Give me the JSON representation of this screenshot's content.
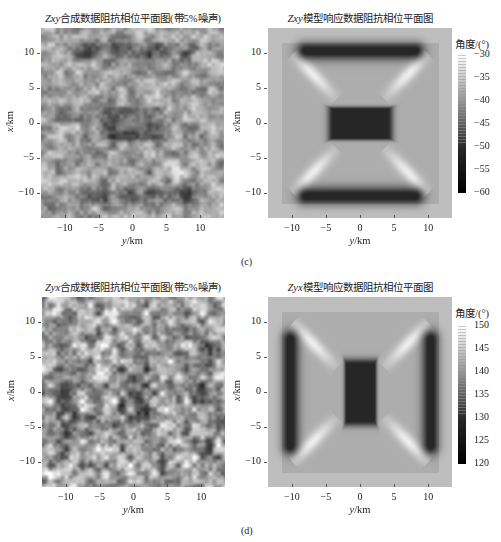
{
  "chart_data": [
    {
      "type": "heatmap",
      "id": "c-left",
      "title_italic": "Zxy",
      "title_rest": "合成数据阻抗相位平面图(带5%噪声)",
      "xlabel_italic": "y",
      "xlabel_rest": "/km",
      "ylabel_italic": "x",
      "ylabel_rest": "/km",
      "xticks": [
        -10,
        -5,
        0,
        5,
        10
      ],
      "yticks": [
        10,
        5,
        0,
        -5,
        -10
      ],
      "xlim": [
        -13.5,
        13.5
      ],
      "ylim": [
        -13.5,
        13.5
      ],
      "colorbar": null,
      "description": "Noisy synthetic Zxy phase map; dark horizontal bands near x=10 and x=-10, dark cluster near center"
    },
    {
      "type": "heatmap",
      "id": "c-right",
      "title_italic": "Zxy",
      "title_rest": "模型响应数据阻抗相位平面图",
      "xlabel_italic": "y",
      "xlabel_rest": "/km",
      "ylabel_italic": "x",
      "ylabel_rest": "/km",
      "xticks": [
        -10,
        -5,
        0,
        5,
        10
      ],
      "yticks": [
        10,
        5,
        0,
        -5,
        -10
      ],
      "xlim": [
        -13.5,
        13.5
      ],
      "ylim": [
        -13.5,
        13.5
      ],
      "colorbar": {
        "title": "角度/(°)",
        "ticks": [
          -30,
          -35,
          -40,
          -45,
          -50,
          -55,
          -60
        ],
        "range": [
          -60,
          -30
        ]
      },
      "description": "Model response Zxy phase; dark horizontal bars at x≈±10, dark rectangle at center, bright diagonal streaks"
    },
    {
      "type": "heatmap",
      "id": "d-left",
      "title_italic": "Zyx",
      "title_rest": "合成数据阻抗相位平面图(带5%噪声)",
      "xlabel_italic": "y",
      "xlabel_rest": "/km",
      "ylabel_italic": "x",
      "ylabel_rest": "/km",
      "xticks": [
        -10,
        -5,
        0,
        5,
        10
      ],
      "yticks": [
        10,
        5,
        0,
        -5,
        -10
      ],
      "xlim": [
        -13.5,
        13.5
      ],
      "ylim": [
        -13.5,
        13.5
      ],
      "colorbar": null,
      "description": "Noisy synthetic Zyx phase map; dark vertical patch near y=-10 and center"
    },
    {
      "type": "heatmap",
      "id": "d-right",
      "title_italic": "Zyx",
      "title_rest": "模型响应数据阻抗相位平面图",
      "xlabel_italic": "y",
      "xlabel_rest": "/km",
      "ylabel_italic": "x",
      "ylabel_rest": "/km",
      "xticks": [
        -10,
        -5,
        0,
        5,
        10
      ],
      "yticks": [
        10,
        5,
        0,
        -5,
        -10
      ],
      "xlim": [
        -13.5,
        13.5
      ],
      "ylim": [
        -13.5,
        13.5
      ],
      "colorbar": {
        "title": "角度/(°)",
        "ticks": [
          150,
          145,
          140,
          135,
          130,
          125,
          120
        ],
        "range": [
          120,
          150
        ]
      },
      "description": "Model response Zyx phase; dark vertical bars at y≈±10, dark vertical rectangle at center, bright diagonal streaks"
    }
  ],
  "panel_labels": {
    "c": "(c)",
    "d": "(d)"
  }
}
